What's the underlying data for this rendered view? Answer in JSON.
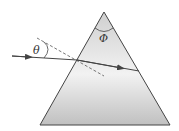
{
  "diagram": {
    "labels": {
      "incidence_angle": "θ",
      "apex_angle": "Φ"
    },
    "colors": {
      "prism_fill_light": "#ececec",
      "prism_fill_dark": "#c4c4c4",
      "stroke": "#444444"
    }
  }
}
